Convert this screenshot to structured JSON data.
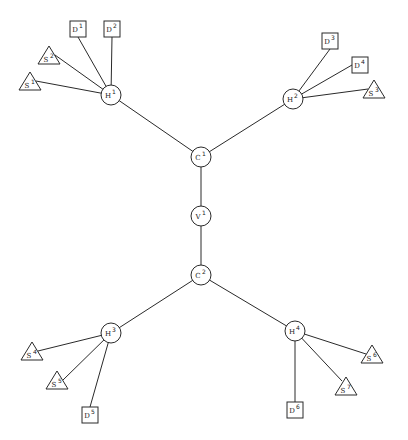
{
  "diagram": {
    "type": "hierarchical tree",
    "background": "#ffffff",
    "stroke_color": "#2a2a2a",
    "nodes": [
      {
        "id": "C1",
        "base": "C",
        "sup": "1",
        "shape": "circle",
        "x": 201,
        "y": 157
      },
      {
        "id": "V1",
        "base": "V",
        "sup": "1",
        "shape": "circle",
        "x": 201,
        "y": 216
      },
      {
        "id": "C2",
        "base": "C",
        "sup": "2",
        "shape": "circle",
        "x": 201,
        "y": 275
      },
      {
        "id": "H1",
        "base": "H",
        "sup": "1",
        "shape": "circle",
        "x": 111,
        "y": 95
      },
      {
        "id": "H2",
        "base": "H",
        "sup": "2",
        "shape": "circle",
        "x": 293,
        "y": 99
      },
      {
        "id": "H3",
        "base": "H",
        "sup": "3",
        "shape": "circle",
        "x": 111,
        "y": 333
      },
      {
        "id": "H4",
        "base": "H",
        "sup": "4",
        "shape": "circle",
        "x": 295,
        "y": 331
      },
      {
        "id": "D1",
        "base": "D",
        "sup": "1",
        "shape": "square",
        "x": 78,
        "y": 29
      },
      {
        "id": "D2",
        "base": "D",
        "sup": "2",
        "shape": "square",
        "x": 112,
        "y": 29
      },
      {
        "id": "D3",
        "base": "D",
        "sup": "3",
        "shape": "square",
        "x": 330,
        "y": 41
      },
      {
        "id": "D4",
        "base": "D",
        "sup": "4",
        "shape": "square",
        "x": 360,
        "y": 65
      },
      {
        "id": "D5",
        "base": "D",
        "sup": "5",
        "shape": "square",
        "x": 90,
        "y": 415
      },
      {
        "id": "D6",
        "base": "D",
        "sup": "6",
        "shape": "square",
        "x": 295,
        "y": 410
      },
      {
        "id": "S1",
        "base": "S",
        "sup": "1",
        "shape": "triangle",
        "x": 30,
        "y": 82
      },
      {
        "id": "S2",
        "base": "S",
        "sup": "2",
        "shape": "triangle",
        "x": 49,
        "y": 56
      },
      {
        "id": "S3",
        "base": "S",
        "sup": "3",
        "shape": "triangle",
        "x": 374,
        "y": 90
      },
      {
        "id": "S4",
        "base": "S",
        "sup": "4",
        "shape": "triangle",
        "x": 32,
        "y": 352
      },
      {
        "id": "S5",
        "base": "S",
        "sup": "5",
        "shape": "triangle",
        "x": 57,
        "y": 381
      },
      {
        "id": "S6",
        "base": "S",
        "sup": "6",
        "shape": "triangle",
        "x": 372,
        "y": 355
      },
      {
        "id": "S7",
        "base": "S",
        "sup": "7",
        "shape": "triangle",
        "x": 346,
        "y": 387
      }
    ],
    "edges": [
      [
        "C1",
        "V1"
      ],
      [
        "V1",
        "C2"
      ],
      [
        "C1",
        "H1"
      ],
      [
        "C1",
        "H2"
      ],
      [
        "C2",
        "H3"
      ],
      [
        "C2",
        "H4"
      ],
      [
        "H1",
        "D1"
      ],
      [
        "H1",
        "D2"
      ],
      [
        "H1",
        "S1"
      ],
      [
        "H1",
        "S2"
      ],
      [
        "H2",
        "D3"
      ],
      [
        "H2",
        "D4"
      ],
      [
        "H2",
        "S3"
      ],
      [
        "H3",
        "S4"
      ],
      [
        "H3",
        "S5"
      ],
      [
        "H3",
        "D5"
      ],
      [
        "H4",
        "S6"
      ],
      [
        "H4",
        "S7"
      ],
      [
        "H4",
        "D6"
      ]
    ]
  }
}
